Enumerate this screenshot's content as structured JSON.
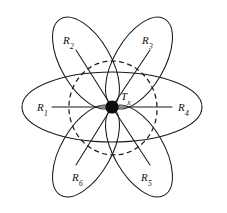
{
  "figure": {
    "type": "antenna-radiation-pattern-diagram",
    "title": "",
    "background_color": "#ffffff",
    "stroke_color": "#1a1a1a",
    "hub_color": "#0d0d0d",
    "center": {
      "x": 112,
      "y": 107
    },
    "transmitter": {
      "id": "Tx",
      "symbol": "T",
      "subscript": "x",
      "label_x": 121,
      "label_y": 91,
      "node_radius": 6.6
    },
    "coverage_ellipse": {
      "style": "dashed",
      "cx": 113,
      "cy": 108,
      "rx": 44,
      "ry": 47,
      "rotation": -8
    },
    "lobes": [
      {
        "id": "lobe-horizontal",
        "cx": 112,
        "cy": 107,
        "rx": 90,
        "ry": 35,
        "rotation": 0
      },
      {
        "id": "lobe-upper-left",
        "cx": 86,
        "cy": 63,
        "rx": 25,
        "ry": 51,
        "rotation": -30
      },
      {
        "id": "lobe-upper-right",
        "cx": 139,
        "cy": 63,
        "rx": 25,
        "ry": 51,
        "rotation": 30
      },
      {
        "id": "lobe-lower-left",
        "cx": 86,
        "cy": 151,
        "rx": 25,
        "ry": 51,
        "rotation": 30
      },
      {
        "id": "lobe-lower-right",
        "cx": 139,
        "cy": 151,
        "rx": 25,
        "ry": 51,
        "rotation": -30
      }
    ],
    "receivers": [
      {
        "id": "R1",
        "symbol": "R",
        "subscript": "1",
        "label_x": 37,
        "label_y": 102,
        "ray": {
          "x1": 52,
          "y1": 107,
          "x2": 112,
          "y2": 107
        },
        "angle_deg": 180
      },
      {
        "id": "R2",
        "symbol": "R",
        "subscript": "2",
        "label_x": 63,
        "label_y": 35,
        "ray": {
          "x1": 76,
          "y1": 50,
          "x2": 112,
          "y2": 107
        },
        "angle_deg": 122
      },
      {
        "id": "R3",
        "symbol": "R",
        "subscript": "3",
        "label_x": 142,
        "label_y": 35,
        "ray": {
          "x1": 150,
          "y1": 50,
          "x2": 112,
          "y2": 107
        },
        "angle_deg": 57
      },
      {
        "id": "R4",
        "symbol": "R",
        "subscript": "4",
        "label_x": 178,
        "label_y": 102,
        "ray": {
          "x1": 172,
          "y1": 107,
          "x2": 112,
          "y2": 107
        },
        "angle_deg": 0
      },
      {
        "id": "R5",
        "symbol": "R",
        "subscript": "5",
        "label_x": 141,
        "label_y": 172,
        "ray": {
          "x1": 150,
          "y1": 165,
          "x2": 112,
          "y2": 107
        },
        "angle_deg": -57
      },
      {
        "id": "R6",
        "symbol": "R",
        "subscript": "6",
        "label_x": 72,
        "label_y": 172,
        "ray": {
          "x1": 76,
          "y1": 165,
          "x2": 112,
          "y2": 107
        },
        "angle_deg": -122
      }
    ]
  }
}
